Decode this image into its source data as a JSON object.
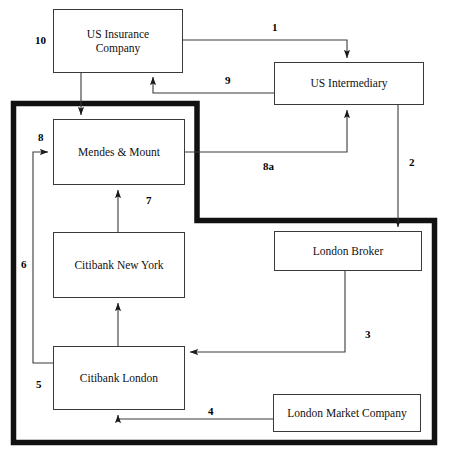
{
  "diagram": {
    "boundary": {
      "name": "thick-boundary-outline",
      "color": "#111111",
      "thickness": 5
    },
    "nodes": [
      {
        "id": "us-insurance-company",
        "label": "US Insurance\nCompany",
        "x": 53,
        "y": 9,
        "w": 130,
        "h": 64
      },
      {
        "id": "us-intermediary",
        "label": "US Intermediary",
        "x": 274,
        "y": 62,
        "w": 150,
        "h": 43
      },
      {
        "id": "mendes-and-mount",
        "label": "Mendes & Mount",
        "x": 53,
        "y": 119,
        "w": 132,
        "h": 66
      },
      {
        "id": "citibank-new-york",
        "label": "Citibank New York",
        "x": 53,
        "y": 232,
        "w": 132,
        "h": 66
      },
      {
        "id": "citibank-london",
        "label": "Citibank London",
        "x": 53,
        "y": 346,
        "w": 132,
        "h": 64
      },
      {
        "id": "london-broker",
        "label": "London Broker",
        "x": 274,
        "y": 231,
        "w": 148,
        "h": 40
      },
      {
        "id": "london-market-company",
        "label": "London Market Company",
        "x": 273,
        "y": 394,
        "w": 148,
        "h": 38
      }
    ],
    "edges": [
      {
        "id": "edge-1",
        "label": "1",
        "from": "us-insurance-company",
        "to": "us-intermediary",
        "lx": 272,
        "ly": 21
      },
      {
        "id": "edge-2",
        "label": "2",
        "from": "us-intermediary",
        "to": "london-broker",
        "lx": 409,
        "ly": 156
      },
      {
        "id": "edge-3",
        "label": "3",
        "from": "london-broker",
        "to": "citibank-london",
        "lx": 365,
        "ly": 328
      },
      {
        "id": "edge-4",
        "label": "4",
        "from": "london-market-company",
        "to": "citibank-london",
        "lx": 208,
        "ly": 405
      },
      {
        "id": "edge-5",
        "label": "5",
        "from": "citibank-london",
        "to": "mendes-and-mount",
        "lx": 36,
        "ly": 378
      },
      {
        "id": "edge-6",
        "label": "6",
        "from": "citibank-london",
        "to": "mendes-and-mount",
        "lx": 21,
        "ly": 258
      },
      {
        "id": "edge-7",
        "label": "7",
        "from": "citibank-new-york",
        "to": "mendes-and-mount",
        "lx": 146,
        "ly": 194
      },
      {
        "id": "edge-8",
        "label": "8",
        "from": "citibank-london",
        "to": "mendes-and-mount",
        "lx": 38,
        "ly": 131
      },
      {
        "id": "edge-8a",
        "label": "8a",
        "from": "mendes-and-mount",
        "to": "us-intermediary",
        "lx": 263,
        "ly": 160
      },
      {
        "id": "edge-9",
        "label": "9",
        "from": "us-intermediary",
        "to": "us-insurance-company",
        "lx": 225,
        "ly": 74
      },
      {
        "id": "edge-10",
        "label": "10",
        "from": "us-insurance-company",
        "to": "mendes-and-mount",
        "lx": 35,
        "ly": 34
      }
    ]
  }
}
